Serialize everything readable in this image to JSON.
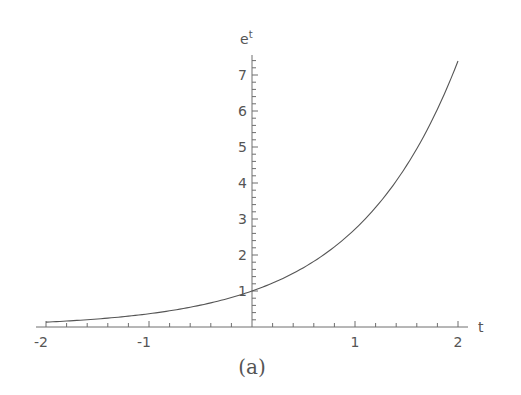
{
  "chart_data": {
    "type": "line",
    "title": "",
    "function": "e^t",
    "xlabel": "t",
    "ylabel": "e^t",
    "ylabel_base": "e",
    "ylabel_exp": "t",
    "caption": "(a)",
    "xlim": [
      -2,
      2
    ],
    "ylim": [
      0,
      7.6
    ],
    "grid": false,
    "legend": null,
    "x_ticks": [
      {
        "value": -2,
        "label": "-2"
      },
      {
        "value": -1,
        "label": "-1"
      },
      {
        "value": 1,
        "label": "1"
      },
      {
        "value": 2,
        "label": "2"
      }
    ],
    "y_ticks": [
      {
        "value": 1,
        "label": "1"
      },
      {
        "value": 2,
        "label": "2"
      },
      {
        "value": 3,
        "label": "3"
      },
      {
        "value": 4,
        "label": "4"
      },
      {
        "value": 5,
        "label": "5"
      },
      {
        "value": 6,
        "label": "6"
      },
      {
        "value": 7,
        "label": "7"
      }
    ],
    "x_minor_step": 0.2,
    "y_minor_step": 0.2,
    "series": [
      {
        "name": "e^t",
        "x": [
          -2,
          -1.5,
          -1,
          -0.5,
          0,
          0.5,
          1,
          1.5,
          2
        ],
        "y": [
          0.135,
          0.223,
          0.368,
          0.607,
          1.0,
          1.649,
          2.718,
          4.482,
          7.389
        ]
      }
    ]
  },
  "layout": {
    "origin_x": 252,
    "origin_y": 327,
    "px_per_x": 103,
    "px_per_y": 36,
    "x_axis_start": 36,
    "x_axis_end": 468,
    "y_axis_top": 55
  }
}
